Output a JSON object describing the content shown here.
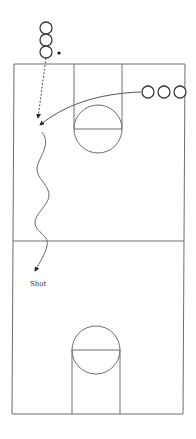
{
  "diagram": {
    "court": {
      "line_color": "#6e6e6e",
      "elements": [
        "sideline-left",
        "sideline-right",
        "baseline-top",
        "baseline-bottom",
        "half-court-line",
        "top-key",
        "top-free-throw-circle",
        "bottom-key",
        "bottom-free-throw-circle"
      ]
    },
    "players": {
      "left_line": {
        "count": 3,
        "has_ball": true
      },
      "right_line": {
        "count": 3,
        "has_ball": false
      }
    },
    "actions": [
      {
        "type": "pass",
        "style": "dashed",
        "from": "left_line",
        "to": "left wing"
      },
      {
        "type": "cut",
        "style": "solid",
        "from": "right_line",
        "to": "left wing"
      },
      {
        "type": "dribble",
        "style": "wavy",
        "from": "left wing",
        "to": "shot spot"
      }
    ],
    "labels": {
      "shot": "Shot"
    }
  }
}
